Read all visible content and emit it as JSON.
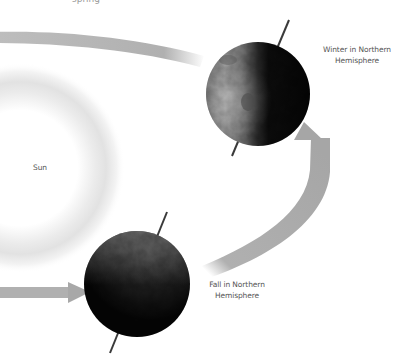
{
  "figure": {
    "clipped_top_text": "spring",
    "sun": {
      "label": "Sun",
      "glow_color": "#d8d8d8"
    },
    "earths": [
      {
        "id": "winter",
        "label_line1": "Winter in Northern",
        "label_line2": "Hemisphere",
        "lit_side": "left"
      },
      {
        "id": "fall",
        "label_line1": "Fall in Northern",
        "label_line2": "Hemisphere",
        "lit_side": "top"
      }
    ],
    "orbit_arrow_color": "#a8a8a8",
    "text_color": "#555555"
  }
}
